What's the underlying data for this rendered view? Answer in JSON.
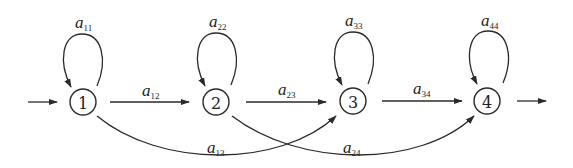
{
  "diagram": {
    "type": "left-to-right HMM state transition diagram",
    "states": [
      {
        "id": "1",
        "label": "1"
      },
      {
        "id": "2",
        "label": "2"
      },
      {
        "id": "3",
        "label": "3"
      },
      {
        "id": "4",
        "label": "4"
      }
    ],
    "self_loops": [
      {
        "state": "1",
        "label": "a",
        "sub": "11"
      },
      {
        "state": "2",
        "label": "a",
        "sub": "22"
      },
      {
        "state": "3",
        "label": "a",
        "sub": "33"
      },
      {
        "state": "4",
        "label": "a",
        "sub": "44"
      }
    ],
    "transitions": [
      {
        "from": "1",
        "to": "2",
        "label": "a",
        "sub": "12"
      },
      {
        "from": "2",
        "to": "3",
        "label": "a",
        "sub": "23"
      },
      {
        "from": "3",
        "to": "4",
        "label": "a",
        "sub": "34"
      },
      {
        "from": "1",
        "to": "3",
        "label": "a",
        "sub": "13"
      },
      {
        "from": "2",
        "to": "4",
        "label": "a",
        "sub": "24"
      }
    ],
    "entry_arrow": "into state 1",
    "exit_arrow": "out of state 4",
    "colors": {
      "stroke": "#2a2a2a",
      "background": "#ffffff"
    }
  }
}
